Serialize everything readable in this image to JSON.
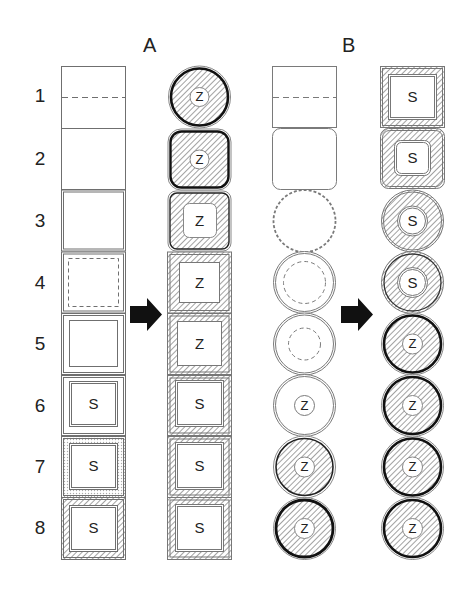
{
  "figure": {
    "panels": [
      {
        "id": "A",
        "title": "A",
        "shape": "square"
      },
      {
        "id": "B",
        "title": "B",
        "shape": "round"
      }
    ],
    "row_labels": [
      "1",
      "2",
      "3",
      "4",
      "5",
      "6",
      "7",
      "8"
    ],
    "arrow": "right-arrow",
    "colors": {
      "line": "#777777",
      "dark": "#111111",
      "hatch": "#9a9a9a",
      "background": "#ffffff"
    },
    "panel_A": {
      "before": [
        {
          "row": 1,
          "desc": "plain square with dashed midline",
          "label": ""
        },
        {
          "row": 2,
          "desc": "plain square",
          "label": ""
        },
        {
          "row": 3,
          "desc": "double-outlined square",
          "label": ""
        },
        {
          "row": 4,
          "desc": "double outline with dashed inner square",
          "label": ""
        },
        {
          "row": 5,
          "desc": "double outline with inner square",
          "label": ""
        },
        {
          "row": 6,
          "desc": "double outline with inner double square",
          "label": "S"
        },
        {
          "row": 7,
          "desc": "stippled ring with inner square",
          "label": "S"
        },
        {
          "row": 8,
          "desc": "hatched ring with inner square",
          "label": "S"
        }
      ],
      "after": [
        {
          "row": 1,
          "desc": "hatched circle, dark ring",
          "label": "Z"
        },
        {
          "row": 2,
          "desc": "hatched rounded square, dark outline",
          "label": "Z"
        },
        {
          "row": 3,
          "desc": "hatched rounded square with rounded inner window",
          "label": "Z"
        },
        {
          "row": 4,
          "desc": "hatched square with inner window",
          "label": "Z"
        },
        {
          "row": 5,
          "desc": "hatched square with inner window",
          "label": "Z"
        },
        {
          "row": 6,
          "desc": "hatched square with inner window",
          "label": "S"
        },
        {
          "row": 7,
          "desc": "hatched square with inner window",
          "label": "S"
        },
        {
          "row": 8,
          "desc": "hatched square with inner window",
          "label": "S"
        }
      ]
    },
    "panel_B": {
      "before": [
        {
          "row": 1,
          "desc": "plain square with dashed midline",
          "label": ""
        },
        {
          "row": 2,
          "desc": "plain rounded square",
          "label": ""
        },
        {
          "row": 3,
          "desc": "circle with dashed outline",
          "label": ""
        },
        {
          "row": 4,
          "desc": "double circle with large dashed inner circle",
          "label": ""
        },
        {
          "row": 5,
          "desc": "double circle with small dashed inner circle",
          "label": ""
        },
        {
          "row": 6,
          "desc": "double circle with small inner circle",
          "label": "Z"
        },
        {
          "row": 7,
          "desc": "hatched circle with dark ring",
          "label": "Z"
        },
        {
          "row": 8,
          "desc": "hatched circle with thick dark ring",
          "label": "Z"
        }
      ],
      "after": [
        {
          "row": 1,
          "desc": "hatched square frame with window",
          "label": "S"
        },
        {
          "row": 2,
          "desc": "hatched rounded square with rounded window",
          "label": "S"
        },
        {
          "row": 3,
          "desc": "hatched circle with inner window",
          "label": "S"
        },
        {
          "row": 4,
          "desc": "hatched circle with inner window",
          "label": "S"
        },
        {
          "row": 5,
          "desc": "hatched circle, dark ring",
          "label": "Z"
        },
        {
          "row": 6,
          "desc": "hatched circle, dark ring",
          "label": "Z"
        },
        {
          "row": 7,
          "desc": "hatched circle, dark ring",
          "label": "Z"
        },
        {
          "row": 8,
          "desc": "hatched circle, dark ring",
          "label": "Z"
        }
      ]
    }
  }
}
